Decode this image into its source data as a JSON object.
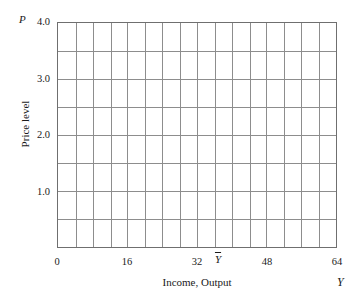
{
  "chart_data": {
    "type": "grid",
    "title": "",
    "subtitle": "",
    "xlabel": "Income, Output",
    "ylabel": "Price level",
    "x_symbol": "Y",
    "y_symbol": "P",
    "xlim": [
      0,
      64
    ],
    "ylim": [
      0,
      4.0
    ],
    "grid": true,
    "grid_color": "#8c8c8c",
    "frame_color": "#6f6f6f",
    "background": "#ffffff",
    "x_major_ticks": [
      0,
      16,
      32,
      48,
      64
    ],
    "x_tick_labels": [
      "0",
      "16",
      "32",
      "48",
      "64"
    ],
    "x_grid_step": 4,
    "x_grid_columns": 16,
    "y_major_ticks": [
      1.0,
      2.0,
      3.0,
      4.0
    ],
    "y_tick_labels": [
      "1.0",
      "2.0",
      "3.0",
      "4.0"
    ],
    "y_grid_step": 0.5,
    "y_grid_rows": 8,
    "annotations": [
      {
        "name": "y-bar-marker",
        "label": "Y",
        "overline": true,
        "x": 36,
        "axis": "x",
        "note": "Y-bar potential output marker between 32 and 48 tick labels"
      }
    ],
    "series": [],
    "legend": null,
    "legend_position": "none"
  },
  "axis": {
    "y_symbol": "P",
    "x_symbol": "Y",
    "y_title": "Price level",
    "x_title": "Income, Output",
    "y_ticks": [
      {
        "value": "4.0",
        "top": 16
      },
      {
        "value": "3.0",
        "top": 73
      },
      {
        "value": "2.0",
        "top": 129
      },
      {
        "value": "1.0",
        "top": 186
      }
    ],
    "x_ticks": [
      {
        "value": "0",
        "left": 37
      },
      {
        "value": "16",
        "left": 107
      },
      {
        "value": "32",
        "left": 177
      },
      {
        "value": "48",
        "left": 247
      },
      {
        "value": "64",
        "left": 317
      }
    ],
    "y_bar": {
      "value": "Y",
      "left": 206
    }
  }
}
